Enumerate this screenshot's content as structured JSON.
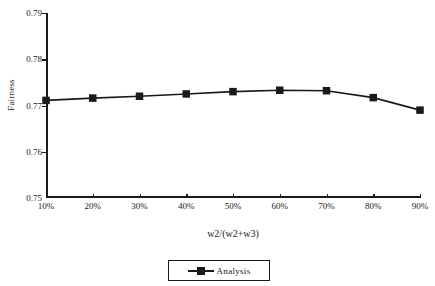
{
  "chart_data": {
    "type": "line",
    "title": "",
    "xlabel": "w2/(w2+w3)",
    "ylabel": "Fairness",
    "categories": [
      "10%",
      "20%",
      "30%",
      "40%",
      "50%",
      "60%",
      "70%",
      "80%",
      "90%"
    ],
    "series": [
      {
        "name": "Analysis",
        "values": [
          0.7711,
          0.7716,
          0.772,
          0.7725,
          0.773,
          0.7733,
          0.7732,
          0.7717,
          0.769
        ],
        "color": "#1a1a1a",
        "marker": "square"
      }
    ],
    "ylim": [
      0.75,
      0.79
    ],
    "yticks": [
      "0.79",
      "0.78",
      "0.77",
      "0.76",
      "0.75"
    ],
    "ytick_values": [
      0.79,
      0.78,
      0.77,
      0.76,
      0.75
    ],
    "grid": false,
    "legend_position": "bottom-center",
    "legend_entries": [
      "Analysis"
    ]
  },
  "axes": {
    "y_title": "Fairness",
    "x_title": "w2/(w2+w3)"
  },
  "legend": {
    "items": [
      {
        "label": "Analysis"
      }
    ]
  }
}
